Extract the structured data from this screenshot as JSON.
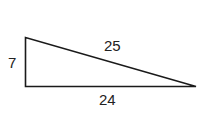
{
  "diagram": {
    "type": "right-triangle",
    "sides": {
      "vertical": "7",
      "hypotenuse": "25",
      "base": "24"
    },
    "stroke_color": "#1a1a1a"
  }
}
